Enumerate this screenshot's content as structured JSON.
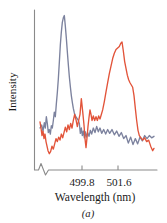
{
  "figure": {
    "caption": "(a)",
    "background": "#ffffff"
  },
  "chart_data": {
    "type": "line",
    "title": "",
    "xlabel": "Wavelength (nm)",
    "ylabel": "Intensity",
    "xticklabels": [
      "499.8",
      "501.6"
    ],
    "xtickvalues": [
      499.8,
      501.6
    ],
    "yticklabels": [],
    "grid": false,
    "legend": null,
    "axis_break": true,
    "axis_break_note": "zigzag break at left end of x-axis",
    "xlim": [
      499.0,
      502.6
    ],
    "ylim": [
      0,
      1
    ],
    "colors": {
      "series_1": "#7c829e",
      "series_2": "#e2543a",
      "axis": "#8a8a8a",
      "text": "#1a1a1a"
    },
    "series": [
      {
        "name": "trace-blue",
        "color": "#7c829e",
        "peak_x": 499.85,
        "peak_y": 0.97,
        "points": [
          [
            499.12,
            0.225
          ],
          [
            499.17,
            0.245
          ],
          [
            499.21,
            0.205
          ],
          [
            499.25,
            0.26
          ],
          [
            499.28,
            0.225
          ],
          [
            499.31,
            0.3
          ],
          [
            499.34,
            0.255
          ],
          [
            499.37,
            0.195
          ],
          [
            499.4,
            0.215
          ],
          [
            499.43,
            0.185
          ],
          [
            499.46,
            0.24
          ],
          [
            499.49,
            0.225
          ],
          [
            499.52,
            0.275
          ],
          [
            499.55,
            0.33
          ],
          [
            499.58,
            0.3
          ],
          [
            499.61,
            0.385
          ],
          [
            499.64,
            0.46
          ],
          [
            499.67,
            0.55
          ],
          [
            499.7,
            0.66
          ],
          [
            499.73,
            0.775
          ],
          [
            499.76,
            0.86
          ],
          [
            499.79,
            0.925
          ],
          [
            499.82,
            0.955
          ],
          [
            499.85,
            0.97
          ],
          [
            499.88,
            0.9
          ],
          [
            499.91,
            0.82
          ],
          [
            499.94,
            0.73
          ],
          [
            499.97,
            0.645
          ],
          [
            500.0,
            0.565
          ],
          [
            500.03,
            0.5
          ],
          [
            500.06,
            0.44
          ],
          [
            500.09,
            0.395
          ],
          [
            500.12,
            0.355
          ],
          [
            500.15,
            0.325
          ],
          [
            500.18,
            0.305
          ],
          [
            500.21,
            0.295
          ],
          [
            500.24,
            0.285
          ],
          [
            500.27,
            0.275
          ],
          [
            500.3,
            0.255
          ],
          [
            500.33,
            0.19
          ],
          [
            500.36,
            0.225
          ],
          [
            500.39,
            0.175
          ],
          [
            500.42,
            0.205
          ],
          [
            500.45,
            0.16
          ],
          [
            500.48,
            0.2
          ],
          [
            500.51,
            0.165
          ],
          [
            500.55,
            0.195
          ],
          [
            500.59,
            0.17
          ],
          [
            500.63,
            0.21
          ],
          [
            500.67,
            0.185
          ],
          [
            500.72,
            0.225
          ],
          [
            500.77,
            0.195
          ],
          [
            500.82,
            0.235
          ],
          [
            500.87,
            0.2
          ],
          [
            500.92,
            0.225
          ],
          [
            500.97,
            0.19
          ],
          [
            501.03,
            0.215
          ],
          [
            501.09,
            0.185
          ],
          [
            501.15,
            0.215
          ],
          [
            501.21,
            0.19
          ],
          [
            501.28,
            0.215
          ],
          [
            501.35,
            0.18
          ],
          [
            501.42,
            0.205
          ],
          [
            501.49,
            0.17
          ],
          [
            501.56,
            0.195
          ],
          [
            501.63,
            0.155
          ],
          [
            501.7,
            0.175
          ],
          [
            501.77,
            0.125
          ],
          [
            501.84,
            0.165
          ],
          [
            501.91,
            0.115
          ],
          [
            501.98,
            0.155
          ],
          [
            502.05,
            0.12
          ],
          [
            502.12,
            0.165
          ],
          [
            502.19,
            0.14
          ],
          [
            502.26,
            0.175
          ],
          [
            502.33,
            0.155
          ],
          [
            502.4,
            0.175
          ],
          [
            502.47,
            0.16
          ],
          [
            502.54,
            0.17
          ]
        ]
      },
      {
        "name": "trace-red",
        "color": "#e2543a",
        "peak_x": 501.58,
        "peak_y": 0.795,
        "points": [
          [
            499.12,
            0.265
          ],
          [
            499.15,
            0.225
          ],
          [
            499.18,
            0.175
          ],
          [
            499.21,
            0.205
          ],
          [
            499.24,
            0.155
          ],
          [
            499.27,
            0.185
          ],
          [
            499.3,
            0.135
          ],
          [
            499.33,
            0.105
          ],
          [
            499.36,
            0.075
          ],
          [
            499.4,
            0.055
          ],
          [
            499.44,
            0.07
          ],
          [
            499.48,
            0.105
          ],
          [
            499.52,
            0.085
          ],
          [
            499.56,
            0.12
          ],
          [
            499.6,
            0.155
          ],
          [
            499.64,
            0.135
          ],
          [
            499.68,
            0.165
          ],
          [
            499.72,
            0.145
          ],
          [
            499.76,
            0.185
          ],
          [
            499.8,
            0.16
          ],
          [
            499.84,
            0.195
          ],
          [
            499.88,
            0.23
          ],
          [
            499.92,
            0.2
          ],
          [
            499.96,
            0.245
          ],
          [
            500.0,
            0.215
          ],
          [
            500.04,
            0.255
          ],
          [
            500.08,
            0.225
          ],
          [
            500.12,
            0.275
          ],
          [
            500.16,
            0.315
          ],
          [
            500.2,
            0.28
          ],
          [
            500.24,
            0.235
          ],
          [
            500.28,
            0.275
          ],
          [
            500.32,
            0.315
          ],
          [
            500.36,
            0.42
          ],
          [
            500.4,
            0.335
          ],
          [
            500.44,
            0.245
          ],
          [
            500.47,
            0.155
          ],
          [
            500.5,
            0.095
          ],
          [
            500.53,
            0.16
          ],
          [
            500.56,
            0.235
          ],
          [
            500.59,
            0.295
          ],
          [
            500.62,
            0.345
          ],
          [
            500.65,
            0.315
          ],
          [
            500.68,
            0.275
          ],
          [
            500.72,
            0.305
          ],
          [
            500.76,
            0.275
          ],
          [
            500.8,
            0.3
          ],
          [
            500.84,
            0.275
          ],
          [
            500.88,
            0.305
          ],
          [
            500.92,
            0.285
          ],
          [
            500.96,
            0.315
          ],
          [
            501.0,
            0.345
          ],
          [
            501.05,
            0.4
          ],
          [
            501.1,
            0.465
          ],
          [
            501.15,
            0.525
          ],
          [
            501.2,
            0.585
          ],
          [
            501.25,
            0.635
          ],
          [
            501.3,
            0.685
          ],
          [
            501.35,
            0.72
          ],
          [
            501.4,
            0.745
          ],
          [
            501.45,
            0.755
          ],
          [
            501.5,
            0.765
          ],
          [
            501.54,
            0.785
          ],
          [
            501.58,
            0.795
          ],
          [
            501.62,
            0.735
          ],
          [
            501.66,
            0.665
          ],
          [
            501.7,
            0.62
          ],
          [
            501.74,
            0.575
          ],
          [
            501.78,
            0.545
          ],
          [
            501.82,
            0.525
          ],
          [
            501.86,
            0.51
          ],
          [
            501.9,
            0.495
          ],
          [
            501.94,
            0.44
          ],
          [
            501.98,
            0.355
          ],
          [
            502.02,
            0.275
          ],
          [
            502.06,
            0.21
          ],
          [
            502.1,
            0.175
          ],
          [
            502.15,
            0.16
          ],
          [
            502.2,
            0.145
          ],
          [
            502.26,
            0.16
          ],
          [
            502.32,
            0.135
          ],
          [
            502.38,
            0.145
          ],
          [
            502.44,
            0.105
          ],
          [
            502.5,
            0.075
          ],
          [
            502.54,
            0.09
          ]
        ]
      }
    ]
  }
}
